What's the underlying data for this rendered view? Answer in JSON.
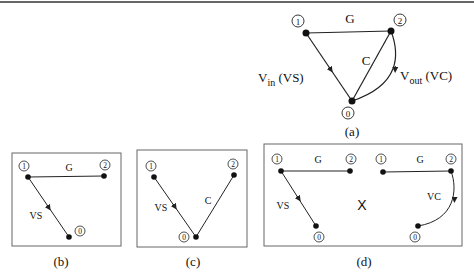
{
  "panels": {
    "a": {
      "caption": "(a)",
      "nodes": {
        "n0": "0",
        "n1": "1",
        "n2": "2"
      },
      "edges": {
        "g": "G",
        "c": "C",
        "vin_main": "V",
        "vin_sub": "in",
        "vin_paren": " (VS)",
        "vout_main": "V",
        "vout_sub": "out",
        "vout_paren": " (VC)"
      }
    },
    "b": {
      "caption": "(b)",
      "nodes": {
        "n0": "0",
        "n1": "1",
        "n2": "2"
      },
      "edges": {
        "g": "G",
        "vs": "VS"
      }
    },
    "c": {
      "caption": "(c)",
      "nodes": {
        "n0": "0",
        "n1": "1",
        "n2": "2"
      },
      "edges": {
        "vs": "VS",
        "c": "C"
      }
    },
    "d": {
      "caption": "(d)",
      "operator": "X",
      "left": {
        "nodes": {
          "n0": "0",
          "n1": "1",
          "n2": "2"
        },
        "edges": {
          "g": "G",
          "vs": "VS"
        }
      },
      "right": {
        "nodes": {
          "n0": "0",
          "n1": "1",
          "n2": "2"
        },
        "edges": {
          "g": "G",
          "vc": "VC"
        }
      }
    }
  },
  "colors": {
    "stroke": "#222222",
    "box": "#666666",
    "text": "#111111"
  }
}
